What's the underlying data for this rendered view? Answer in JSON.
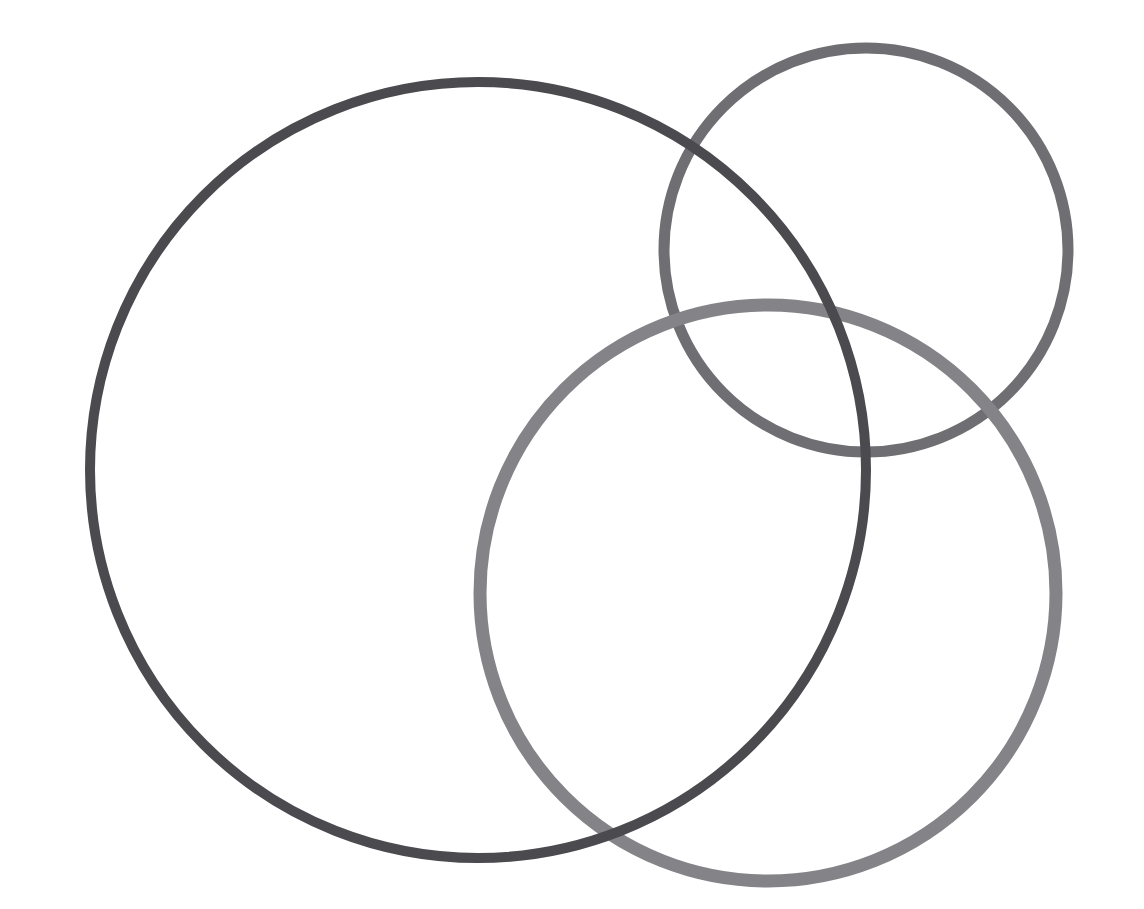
{
  "canvas": {
    "width": 1144,
    "height": 909,
    "background_color": "#ffffff",
    "title": "Three Overlapping Circle Outlines"
  },
  "palette": {
    "background": "#ffffff",
    "dark_gray": "#4a4a4f",
    "medium_gray": "#6e6e73",
    "light_gray": "#838388"
  },
  "shapes": [
    {
      "name": "medium-gray-circle",
      "label": "Top-right circle",
      "cx": 866,
      "cy": 250,
      "r": 202,
      "stroke_width": 11,
      "stroke_color": "#6e6e73",
      "fill": "none",
      "z_order": 1
    },
    {
      "name": "light-gray-circle",
      "label": "Bottom-right circle",
      "cx": 768,
      "cy": 593,
      "r": 288,
      "stroke_width": 13,
      "stroke_color": "#838388",
      "fill": "none",
      "z_order": 2
    },
    {
      "name": "dark-gray-circle",
      "label": "Large left circle",
      "cx": 478,
      "cy": 470,
      "r": 388,
      "stroke_width": 10,
      "stroke_color": "#4a4a4f",
      "fill": "none",
      "z_order": 3
    }
  ],
  "chart_data": {
    "type": "scatter",
    "subtitle": "",
    "xlabel": "",
    "ylabel": "",
    "xlim": [
      0,
      1144
    ],
    "ylim": [
      0,
      909
    ],
    "grid": false,
    "legend_position": "none",
    "annotations": [],
    "series": [
      {
        "name": "Large left circle",
        "color": "#4a4a4f",
        "center": [
          478,
          470
        ],
        "radius": 388,
        "stroke_width": 10,
        "bounds": {
          "left": 90,
          "right": 866,
          "top": 82,
          "bottom": 858
        }
      },
      {
        "name": "Top-right circle",
        "color": "#6e6e73",
        "center": [
          866,
          250
        ],
        "radius": 202,
        "stroke_width": 11,
        "bounds": {
          "left": 664,
          "right": 1068,
          "top": 48,
          "bottom": 452
        }
      },
      {
        "name": "Bottom-right circle",
        "color": "#838388",
        "center": [
          768,
          593
        ],
        "radius": 288,
        "stroke_width": 13,
        "bounds": {
          "left": 480,
          "right": 1056,
          "top": 305,
          "bottom": 881
        }
      }
    ]
  }
}
